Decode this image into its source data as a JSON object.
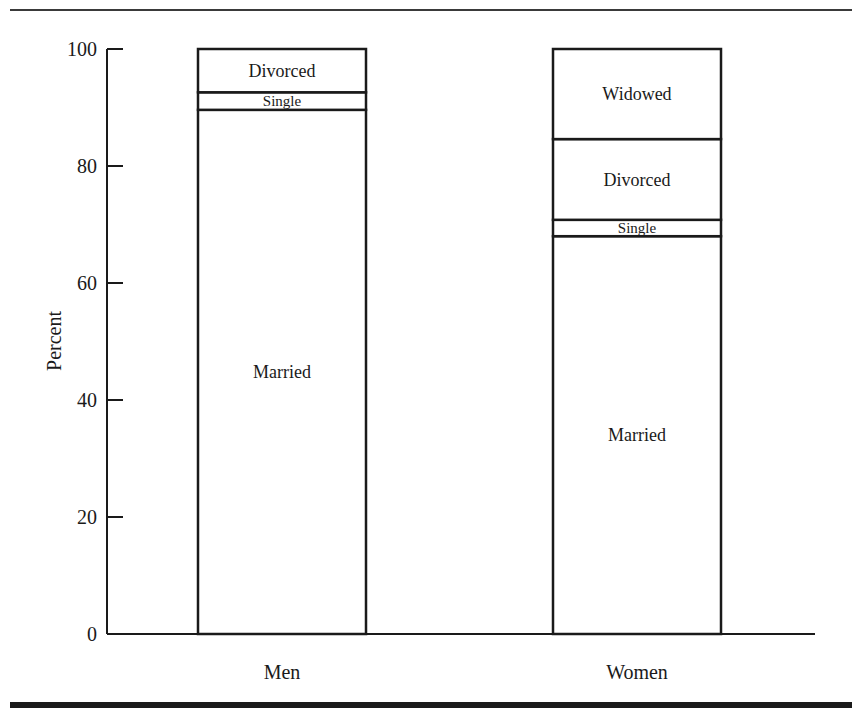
{
  "chart_data": {
    "type": "bar",
    "stacked": true,
    "title": "",
    "xlabel": "",
    "ylabel": "Percent",
    "ylim": [
      0,
      100
    ],
    "yticks": [
      0,
      20,
      40,
      60,
      80,
      100
    ],
    "categories": [
      "Men",
      "Women"
    ],
    "series": [
      {
        "name": "Married",
        "values": [
          89.6,
          68.0
        ]
      },
      {
        "name": "Single",
        "values": [
          3.0,
          2.8
        ]
      },
      {
        "name": "Divorced",
        "values": [
          7.4,
          13.8
        ]
      },
      {
        "name": "Widowed",
        "values": [
          0.0,
          15.4
        ]
      }
    ],
    "segment_labels": {
      "Men": [
        "Married",
        "Single",
        "Divorced"
      ],
      "Women": [
        "Married",
        "Single",
        "Divorced",
        "Widowed"
      ]
    },
    "grid": false,
    "legend": "none (labels inside segments)"
  },
  "colors": {
    "ink": "#1a1a1a",
    "fill": "#ffffff"
  }
}
